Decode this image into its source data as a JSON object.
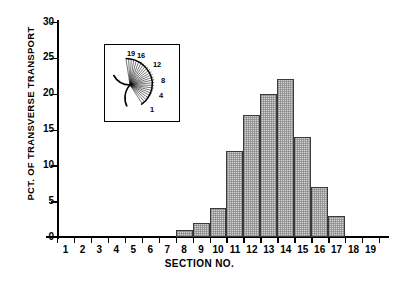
{
  "chart_data": {
    "type": "bar",
    "title": "",
    "xlabel": "SECTION NO.",
    "ylabel": "PCT. OF TRANSVERSE TRANSPORT",
    "categories": [
      "1",
      "2",
      "3",
      "4",
      "5",
      "6",
      "7",
      "8",
      "9",
      "10",
      "11",
      "12",
      "13",
      "14",
      "15",
      "16",
      "17",
      "18",
      "19"
    ],
    "values": [
      0,
      0,
      0,
      0,
      0,
      0,
      0,
      1,
      2,
      4,
      12,
      17,
      20,
      22,
      14,
      7,
      3,
      0,
      0
    ],
    "ylim": [
      0,
      30
    ],
    "yticks": [
      0,
      5,
      10,
      15,
      20,
      25,
      30
    ],
    "ytick_labels": [
      "0",
      "5",
      "10",
      "15",
      "20",
      "25",
      "30"
    ],
    "xlim": [
      0,
      19
    ],
    "grid": false,
    "legend": "none",
    "bar_fill": "#d2d2d2",
    "bar_edge": "#3a3a3a"
  },
  "inset": {
    "name": "fan-rose-diagram",
    "labels": [
      {
        "text": "19",
        "x": 22,
        "y": 11
      },
      {
        "text": "16",
        "x": 32,
        "y": 13
      },
      {
        "text": "12",
        "x": 48,
        "y": 22
      },
      {
        "text": "8",
        "x": 56,
        "y": 38
      },
      {
        "text": "4",
        "x": 54,
        "y": 53
      },
      {
        "text": "1",
        "x": 45,
        "y": 67
      }
    ]
  },
  "colors": {
    "axis": "#000000",
    "bar_fill": "#d2d2d2",
    "bar_edge": "#3a3a3a",
    "background": "#ffffff"
  }
}
